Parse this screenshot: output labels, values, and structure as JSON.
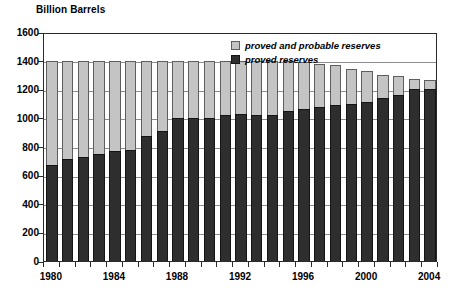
{
  "chart_data": {
    "type": "bar",
    "title": "",
    "ylabel": "Billion Barrels",
    "xlabel": "",
    "ylim": [
      0,
      1600
    ],
    "ytick_step": 200,
    "yticks": [
      0,
      200,
      400,
      600,
      800,
      1000,
      1200,
      1400,
      1600
    ],
    "grid": true,
    "stacked": true,
    "legend_position": "top-right",
    "categories": [
      "1980",
      "1981",
      "1982",
      "1983",
      "1984",
      "1985",
      "1986",
      "1987",
      "1988",
      "1989",
      "1990",
      "1991",
      "1992",
      "1993",
      "1994",
      "1995",
      "1996",
      "1997",
      "1998",
      "1999",
      "2000",
      "2001",
      "2002",
      "2003",
      "2004"
    ],
    "xtick_labels": [
      "1980",
      "1984",
      "1988",
      "1992",
      "1996",
      "2000",
      "2004"
    ],
    "xtick_label_indices": [
      0,
      4,
      8,
      12,
      16,
      20,
      24
    ],
    "series": [
      {
        "name": "proved and probable reserves",
        "color": "#c4c4c4",
        "values": [
          1400,
          1400,
          1400,
          1400,
          1400,
          1400,
          1400,
          1400,
          1400,
          1400,
          1400,
          1400,
          1400,
          1400,
          1400,
          1400,
          1390,
          1380,
          1370,
          1340,
          1330,
          1300,
          1290,
          1270,
          1265
        ]
      },
      {
        "name": "proved reserves",
        "color": "#2e2e2e",
        "values": [
          670,
          710,
          725,
          750,
          770,
          775,
          870,
          905,
          1000,
          1000,
          1000,
          1020,
          1025,
          1020,
          1020,
          1045,
          1065,
          1075,
          1090,
          1100,
          1110,
          1140,
          1160,
          1200,
          1205
        ]
      }
    ]
  },
  "legend": {
    "items": [
      {
        "label": "proved and probable reserves",
        "swatch": "total"
      },
      {
        "label": "proved reserves",
        "swatch": "proved"
      }
    ]
  }
}
